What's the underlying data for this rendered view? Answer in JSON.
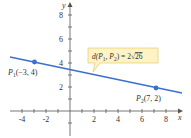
{
  "diagram": {
    "type": "coordinate-plane-line-segment",
    "axes": {
      "x_label": "x",
      "y_label": "y",
      "x_ticks": [
        "-4",
        "-2",
        "2",
        "4",
        "6",
        "8"
      ],
      "y_ticks": [
        "2",
        "4",
        "6",
        "8"
      ],
      "x_range": [
        -5,
        9
      ],
      "y_range": [
        -2,
        9
      ],
      "axis_color": "#555555"
    },
    "points": [
      {
        "name": "P",
        "sub": "1",
        "coords": "(−3, 4)",
        "x": -3,
        "y": 4
      },
      {
        "name": "P",
        "sub": "2",
        "coords": "(7, 2)",
        "x": 7,
        "y": 2
      }
    ],
    "line": {
      "color": "#3a6fd0"
    },
    "callout": {
      "prefix": "d(P",
      "sub1": "1",
      "mid": ", P",
      "sub2": "2",
      "suffix": ") = 2",
      "radicand": "26",
      "background": "#fdf3c4",
      "border": "#e8c96a"
    }
  }
}
